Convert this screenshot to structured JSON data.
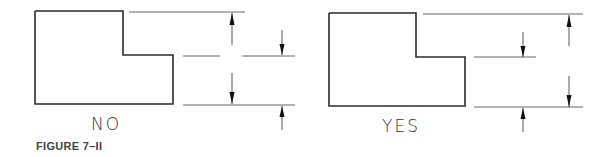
{
  "figure": {
    "caption": "FIGURE 7–II",
    "panels": [
      {
        "id": "no",
        "label": "NO",
        "description": "Stepped L-shape dimensioned with chained/crossing dimension lines (incorrect)"
      },
      {
        "id": "yes",
        "label": "YES",
        "description": "Stepped L-shape dimensioned with separated, non-crossing dimension lines (correct)"
      }
    ]
  },
  "colors": {
    "outline": "#2b2b2b",
    "dimension_line": "#444444",
    "text": "#333333"
  }
}
